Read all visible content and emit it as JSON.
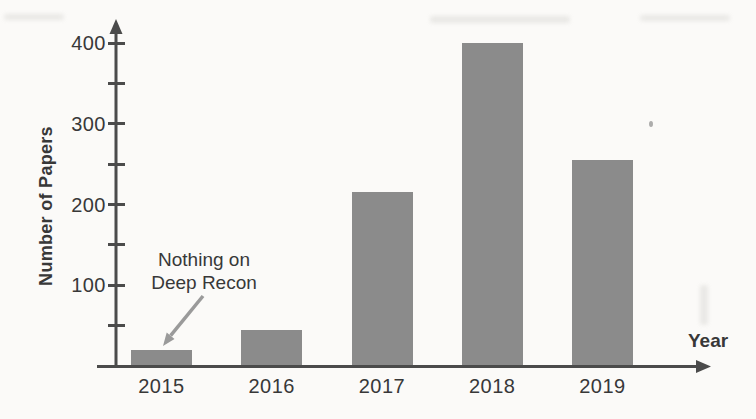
{
  "chart_data": {
    "type": "bar",
    "title": "",
    "xlabel": "Year",
    "ylabel": "Number of Papers",
    "categories": [
      "2015",
      "2016",
      "2017",
      "2018",
      "2019"
    ],
    "values": [
      20,
      45,
      215,
      400,
      255
    ],
    "ylim": [
      0,
      430
    ],
    "yticks_labeled": [
      100,
      200,
      300,
      400
    ],
    "yticks_minor": [
      50,
      150,
      250,
      350
    ],
    "grid": false,
    "legend": null,
    "annotation": {
      "lines": [
        "Nothing on",
        "Deep Recon"
      ],
      "target_category": "2015"
    },
    "colors": {
      "bar": "#8b8b8b",
      "axis": "#4b4b4b",
      "text": "#383838",
      "arrow": "#9a9a9a",
      "background": "#fbfaf8"
    }
  }
}
